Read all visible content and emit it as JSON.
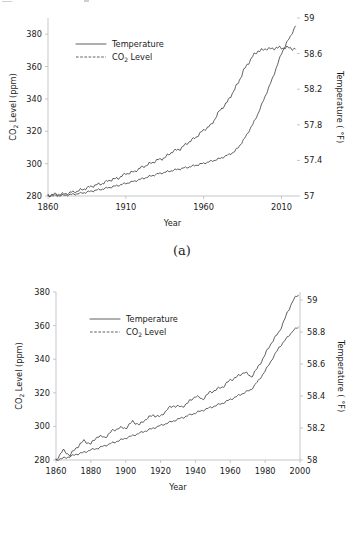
{
  "figures": [
    {
      "caption": "(a)",
      "legend": [
        {
          "label": "Temperature",
          "style": "solid"
        },
        {
          "label": "CO2 Level",
          "style": "dashed-dot",
          "sub": "2",
          "pre": "CO",
          "post": " Level"
        }
      ],
      "y_left_title_pre": "CO",
      "y_left_title_sub": "2",
      "y_left_title_post": " Level (ppm)",
      "y_right_title": "Temperature ( °F)",
      "x_title": "Year"
    },
    {
      "caption": "(b)",
      "legend": [
        {
          "label": "Temperature",
          "style": "solid"
        },
        {
          "label": "CO2 Level",
          "style": "dashed-dot",
          "sub": "2",
          "pre": "CO",
          "post": " Level"
        }
      ],
      "y_left_title_pre": "CO",
      "y_left_title_sub": "2",
      "y_left_title_post": " Level (ppm)",
      "y_right_title": "Temperature ( °F)",
      "x_title": "Year"
    }
  ],
  "chart_data": [
    {
      "type": "line",
      "title": "(a)",
      "xlabel": "Year",
      "ylabel": "CO2 Level (ppm)",
      "y2label": "Temperature ( °F)",
      "xlim": [
        1860,
        2020
      ],
      "ylim": [
        280,
        390
      ],
      "y2lim": [
        57.0,
        59.0
      ],
      "xticks": [
        1860,
        1910,
        1960,
        2010
      ],
      "yticks": [
        280,
        300,
        320,
        340,
        360,
        380
      ],
      "y2ticks": [
        57,
        57.4,
        57.8,
        58.2,
        58.6,
        59
      ],
      "grid": false,
      "legend_position": "upper-left-inside",
      "series": [
        {
          "name": "Temperature",
          "axis": "right",
          "units": "°F",
          "x": [
            1860,
            1865,
            1870,
            1875,
            1880,
            1885,
            1890,
            1895,
            1900,
            1905,
            1910,
            1915,
            1920,
            1925,
            1930,
            1935,
            1940,
            1945,
            1950,
            1955,
            1960,
            1965,
            1970,
            1975,
            1980,
            1983,
            1986,
            1989,
            1992,
            1995,
            1998,
            2001,
            2004,
            2007,
            2010,
            2013,
            2016,
            2019
          ],
          "values": [
            57.01,
            57.02,
            57.02,
            57.04,
            57.06,
            57.09,
            57.12,
            57.14,
            57.18,
            57.2,
            57.25,
            57.27,
            57.32,
            57.36,
            57.4,
            57.43,
            57.5,
            57.53,
            57.6,
            57.66,
            57.74,
            57.8,
            57.95,
            58.05,
            58.2,
            58.3,
            58.42,
            58.5,
            58.58,
            58.63,
            58.64,
            58.66,
            58.65,
            58.67,
            58.66,
            58.67,
            58.66,
            58.65
          ]
        },
        {
          "name": "CO2 Level",
          "axis": "left",
          "units": "ppm",
          "x": [
            1860,
            1865,
            1870,
            1875,
            1880,
            1885,
            1890,
            1895,
            1900,
            1905,
            1910,
            1915,
            1920,
            1925,
            1930,
            1935,
            1940,
            1945,
            1950,
            1955,
            1960,
            1965,
            1970,
            1975,
            1980,
            1983,
            1986,
            1989,
            1992,
            1995,
            1998,
            2001,
            2004,
            2007,
            2010,
            2013,
            2016,
            2019
          ],
          "values": [
            280.0,
            280.2,
            280.4,
            280.9,
            281.5,
            282.4,
            283.4,
            284.3,
            285.4,
            286.5,
            287.8,
            289.0,
            290.5,
            292.0,
            293.5,
            294.6,
            295.8,
            296.8,
            297.8,
            299.0,
            300.2,
            301.5,
            303.0,
            305.0,
            307.5,
            311.0,
            315.0,
            320.0,
            325.0,
            331.0,
            338.0,
            345.0,
            352.0,
            360.0,
            368.0,
            374.0,
            379.0,
            385.0
          ]
        }
      ]
    },
    {
      "type": "line",
      "title": "(b)",
      "xlabel": "Year",
      "ylabel": "CO2 Level (ppm)",
      "y2label": "Temperature ( °F)",
      "xlim": [
        1860,
        2000
      ],
      "ylim": [
        280,
        380
      ],
      "y2lim": [
        58.0,
        59.05
      ],
      "xticks": [
        1860,
        1880,
        1900,
        1920,
        1940,
        1960,
        1980,
        2000
      ],
      "yticks": [
        280,
        300,
        320,
        340,
        360,
        380
      ],
      "y2ticks": [
        58,
        58.2,
        58.4,
        58.6,
        58.8,
        59
      ],
      "grid": false,
      "legend_position": "upper-left-inside",
      "series": [
        {
          "name": "Temperature",
          "axis": "right",
          "units": "°F",
          "x": [
            1860,
            1864,
            1868,
            1872,
            1876,
            1880,
            1884,
            1888,
            1892,
            1896,
            1900,
            1904,
            1908,
            1912,
            1916,
            1920,
            1924,
            1928,
            1932,
            1936,
            1940,
            1944,
            1948,
            1952,
            1956,
            1960,
            1964,
            1968,
            1972,
            1976,
            1980,
            1984,
            1988,
            1992,
            1996,
            1999
          ],
          "values": [
            58.0,
            58.06,
            58.03,
            58.08,
            58.12,
            58.1,
            58.15,
            58.14,
            58.18,
            58.2,
            58.2,
            58.24,
            58.22,
            58.26,
            58.28,
            58.27,
            58.32,
            58.34,
            58.33,
            58.36,
            58.4,
            58.38,
            58.42,
            58.44,
            58.46,
            58.5,
            58.52,
            58.55,
            58.52,
            58.58,
            58.66,
            58.74,
            58.8,
            58.9,
            59.0,
            59.03
          ]
        },
        {
          "name": "CO2 Level",
          "axis": "left",
          "units": "ppm",
          "x": [
            1860,
            1864,
            1868,
            1872,
            1876,
            1880,
            1884,
            1888,
            1892,
            1896,
            1900,
            1904,
            1908,
            1912,
            1916,
            1920,
            1924,
            1928,
            1932,
            1936,
            1940,
            1944,
            1948,
            1952,
            1956,
            1960,
            1964,
            1968,
            1972,
            1976,
            1980,
            1984,
            1988,
            1992,
            1996,
            1999
          ],
          "values": [
            280,
            281,
            282,
            283.5,
            284.5,
            286,
            287,
            288.5,
            290,
            291.5,
            293,
            294.5,
            296,
            297.5,
            299,
            300.5,
            302,
            303.5,
            305,
            306.5,
            308,
            309.5,
            311,
            312.5,
            314,
            316,
            318,
            320,
            322,
            327,
            333,
            340,
            347,
            352,
            357,
            359
          ]
        }
      ]
    }
  ]
}
